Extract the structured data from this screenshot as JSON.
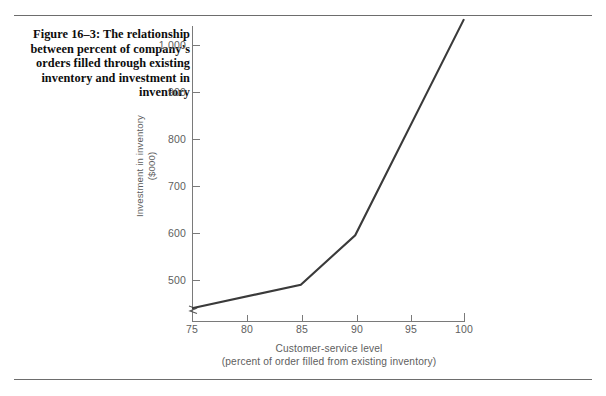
{
  "figure": {
    "caption": "Figure 16–3: The relationship between percent of company’s orders filled through existing inventory and investment in inventory"
  },
  "chart_data": {
    "type": "line",
    "title": "",
    "xlabel": "Customer-service level",
    "xlabel_sub": "(percent of order filled from existing inventory)",
    "ylabel": "Investment in inventory",
    "ylabel_sub": "($000)",
    "x": [
      75,
      85,
      90,
      100
    ],
    "values": [
      440,
      490,
      595,
      1055
    ],
    "series": [
      {
        "name": "Investment in inventory",
        "x": [
          75,
          85,
          90,
          100
        ],
        "values": [
          440,
          490,
          595,
          1055
        ]
      }
    ],
    "xticks": [
      "75",
      "80",
      "85",
      "90",
      "95",
      "100"
    ],
    "xtick_values": [
      75,
      80,
      85,
      90,
      95,
      100
    ],
    "yticks": [
      "500",
      "600",
      "700",
      "800",
      "900",
      "1,000"
    ],
    "ytick_values": [
      500,
      600,
      700,
      800,
      900,
      1000
    ],
    "xlim": [
      75,
      100
    ],
    "ylim": [
      420,
      1075
    ],
    "grid": false,
    "legend": false,
    "axis_break": "y-axis break below 500",
    "line_color": "#3a3a3a",
    "axis_color": "#7a7a7a",
    "tick_label_color": "#5e5e5e"
  }
}
